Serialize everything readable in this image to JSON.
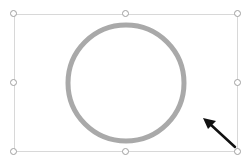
{
  "canvas": {
    "shape": "circle",
    "shape_stroke_color": "#a9a9a9",
    "selection_border_color": "#d8d8d8",
    "handle_color": "#a0a0a0",
    "cursor_icon": "arrow-cursor-icon",
    "cursor_color": "#111111"
  }
}
